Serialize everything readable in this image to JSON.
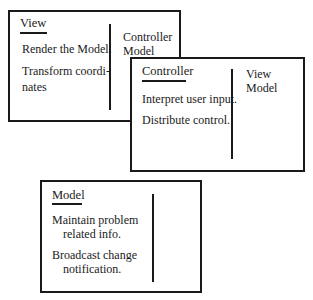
{
  "cards": {
    "view": {
      "title": "View",
      "responsibilities": [
        "Render the Model.",
        "Transform coordi-",
        "nates"
      ],
      "collaborators": [
        "Controller",
        "Model"
      ]
    },
    "controller": {
      "title": "Controller",
      "responsibilities": [
        "Interpret user input.",
        "Distribute control."
      ],
      "collaborators": [
        "View",
        "Model"
      ]
    },
    "model": {
      "title": "Model",
      "responsibilities": [
        "Maintain problem",
        "related info.",
        "Broadcast change",
        "notification."
      ],
      "collaborators": []
    }
  }
}
